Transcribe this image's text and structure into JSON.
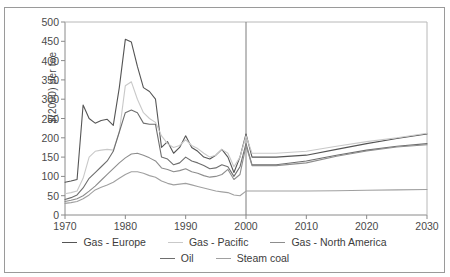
{
  "title": "",
  "axes": {
    "ylabel": "$(2000) per toe",
    "yticks": [
      0,
      50,
      100,
      150,
      200,
      250,
      300,
      350,
      400,
      450,
      500
    ],
    "xticks": [
      1970,
      1980,
      1990,
      2000,
      2010,
      2020,
      2030
    ],
    "divider_year": 2000
  },
  "legend": {
    "row1": [
      {
        "label": "Gas - Europe",
        "color": "#555555"
      },
      {
        "label": "Gas - Pacific",
        "color": "#c9c9c9"
      },
      {
        "label": "Gas - North America",
        "color": "#8d8d8d"
      }
    ],
    "row2": [
      {
        "label": "Oil",
        "color": "#6e6e6e"
      },
      {
        "label": "Steam coal",
        "color": "#a0a0a0"
      }
    ]
  },
  "chart_data": {
    "type": "line",
    "title": "",
    "xlabel": "",
    "ylabel": "$(2000) per toe",
    "xlim": [
      1970,
      2030
    ],
    "ylim": [
      0,
      500
    ],
    "grid": false,
    "legend_position": "bottom",
    "annotations": [
      {
        "type": "vline",
        "x": 2000,
        "note": "history / projection divider"
      }
    ],
    "x": [
      1970,
      1971,
      1972,
      1973,
      1974,
      1975,
      1976,
      1977,
      1978,
      1979,
      1980,
      1981,
      1982,
      1983,
      1984,
      1985,
      1986,
      1987,
      1988,
      1989,
      1990,
      1991,
      1992,
      1993,
      1994,
      1995,
      1996,
      1997,
      1998,
      1999,
      2000,
      2001,
      2002,
      2003,
      2004,
      2005,
      2010,
      2015,
      2020,
      2025,
      2030
    ],
    "series": [
      {
        "name": "Oil",
        "color": "#555555",
        "values": [
          85,
          88,
          92,
          285,
          250,
          238,
          245,
          248,
          232,
          330,
          455,
          448,
          385,
          330,
          320,
          300,
          175,
          190,
          160,
          175,
          205,
          175,
          165,
          150,
          145,
          155,
          170,
          150,
          110,
          150,
          210,
          150,
          150,
          150,
          150,
          150,
          155,
          170,
          185,
          198,
          210
        ]
      },
      {
        "name": "Gas - Pacific",
        "color": "#c9c9c9",
        "values": [
          55,
          58,
          62,
          95,
          150,
          165,
          168,
          170,
          168,
          215,
          335,
          345,
          300,
          265,
          250,
          240,
          205,
          185,
          175,
          180,
          195,
          180,
          172,
          160,
          150,
          155,
          170,
          160,
          125,
          150,
          205,
          160,
          160,
          160,
          160,
          160,
          165,
          178,
          190,
          200,
          212
        ]
      },
      {
        "name": "Gas - Europe",
        "color": "#6e6e6e",
        "values": [
          40,
          45,
          52,
          70,
          95,
          110,
          125,
          140,
          165,
          215,
          265,
          272,
          265,
          238,
          235,
          235,
          150,
          145,
          130,
          135,
          150,
          140,
          135,
          128,
          120,
          122,
          130,
          125,
          100,
          125,
          185,
          130,
          130,
          130,
          130,
          130,
          140,
          155,
          168,
          178,
          185
        ]
      },
      {
        "name": "Gas - North America",
        "color": "#8d8d8d",
        "values": [
          35,
          38,
          42,
          50,
          62,
          75,
          90,
          105,
          120,
          135,
          148,
          158,
          160,
          155,
          148,
          140,
          122,
          118,
          112,
          115,
          120,
          112,
          108,
          102,
          98,
          100,
          105,
          118,
          92,
          105,
          180,
          128,
          128,
          128,
          128,
          128,
          135,
          152,
          166,
          176,
          182
        ]
      },
      {
        "name": "Steam coal",
        "color": "#a0a0a0",
        "values": [
          30,
          32,
          35,
          42,
          52,
          65,
          72,
          78,
          85,
          95,
          105,
          112,
          112,
          108,
          102,
          98,
          88,
          82,
          78,
          80,
          82,
          78,
          74,
          70,
          66,
          62,
          60,
          58,
          52,
          50,
          62,
          62,
          62,
          62,
          62,
          62,
          62,
          63,
          64,
          65,
          66
        ]
      }
    ]
  }
}
